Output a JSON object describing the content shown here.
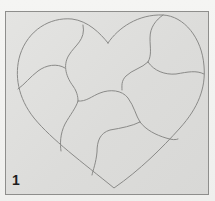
{
  "figure": {
    "step_label": "1",
    "colors": {
      "background": "#f4f4f2",
      "panel": "#e0e0de",
      "panel_border": "#8e8e8c",
      "line": "#8a8a88",
      "label": "#1e1e1e"
    },
    "piece_count": 9
  }
}
